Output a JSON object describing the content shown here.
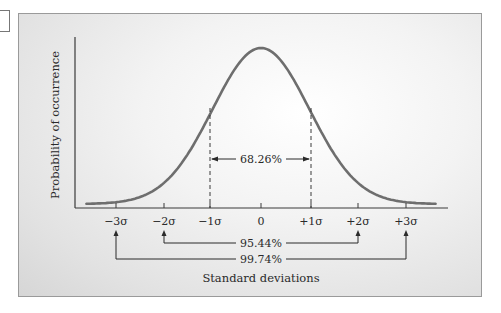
{
  "chart_data": {
    "type": "line",
    "title": "",
    "xlabel": "Standard deviations",
    "ylabel": "Probability of occurrence",
    "x_ticks": [
      "−3σ",
      "−2σ",
      "−1σ",
      "0",
      "+1σ",
      "+2σ",
      "+3σ"
    ],
    "x_values": [
      -3,
      -2,
      -1,
      0,
      1,
      2,
      3
    ],
    "series": [
      {
        "name": "Normal distribution",
        "x": [
          -3.5,
          -3,
          -2.5,
          -2,
          -1.5,
          -1,
          -0.5,
          0,
          0.5,
          1,
          1.5,
          2,
          2.5,
          3,
          3.5
        ],
        "values": [
          0.0009,
          0.0044,
          0.0175,
          0.054,
          0.1295,
          0.242,
          0.352,
          0.3989,
          0.352,
          0.242,
          0.1295,
          0.054,
          0.0175,
          0.0044,
          0.0009
        ]
      }
    ],
    "annotations": [
      {
        "label": "68.26%",
        "range": [
          -1,
          1
        ],
        "style": "dashed bounds with double arrow"
      },
      {
        "label": "95.44%",
        "range": [
          -2,
          2
        ],
        "style": "bracket with arrows below axis"
      },
      {
        "label": "99.74%",
        "range": [
          -3,
          3
        ],
        "style": "bracket with arrows below axis"
      }
    ],
    "xlim": [
      -3.5,
      3.5
    ],
    "grid": false,
    "legend": "none"
  },
  "labels": {
    "ylabel": "Probability of occurrence",
    "xlabel": "Standard deviations",
    "pct_1sigma": "68.26%",
    "pct_2sigma": "95.44%",
    "pct_3sigma": "99.74%",
    "ticks": [
      "−3σ",
      "−2σ",
      "−1σ",
      "0",
      "+1σ",
      "+2σ",
      "+3σ"
    ]
  },
  "colors": {
    "curve": "#6e6e6e",
    "axis": "#3a3a3a",
    "text": "#2a2a2a"
  }
}
